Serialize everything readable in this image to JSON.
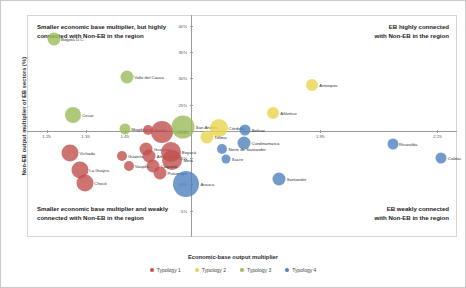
{
  "chart_data": {
    "type": "scatter",
    "title": "",
    "xlabel": "Economic-base output multiplier",
    "ylabel": "Non-EB output multiplier of EB sectors (%)",
    "xlim": [
      1.2,
      2.3
    ],
    "ylim": [
      0.0,
      42.0
    ],
    "xticks": [
      "1.25",
      "1.35",
      "1.45",
      "1.95",
      "2.25"
    ],
    "xtick_values": [
      1.25,
      1.35,
      1.45,
      1.95,
      2.25
    ],
    "yticks": [
      "40%",
      "35%",
      "30%",
      "25%",
      "20%",
      "15%",
      "10%",
      "5%"
    ],
    "ytick_values": [
      40,
      35,
      30,
      25,
      20,
      15,
      10,
      5
    ],
    "grid": false,
    "legend_position": "bottom",
    "quadrant_x": 1.62,
    "quadrant_y": 20.0,
    "annotations": {
      "top_left": "Smaller economic base multiplier, but highly\nconnected with Non-EB in the region",
      "top_right": "EB highly connected\nwith Non-EB in the region",
      "bottom_left": "Smaller economic base multiplier and weakly\nconnected with Non-EB in the region",
      "bottom_right": "EB weakly connected\nwith Non-EB in the region"
    },
    "series": [
      {
        "name": "Typology 1",
        "color": "#c0504d"
      },
      {
        "name": "Typology 2",
        "color": "#e8d44d"
      },
      {
        "name": "Typology 3",
        "color": "#9bbb59"
      },
      {
        "name": "Typology 4",
        "color": "#4f81bd"
      }
    ],
    "points": [
      {
        "label": "Bogotá D.C.",
        "x": 1.268,
        "y": 37.5,
        "size": 13,
        "series": "Typology 3"
      },
      {
        "label": "Valle del Cauca",
        "x": 1.455,
        "y": 30.2,
        "size": 13,
        "series": "Typology 3"
      },
      {
        "label": "Cesar",
        "x": 1.318,
        "y": 23.0,
        "size": 16,
        "series": "Typology 3"
      },
      {
        "label": "Magdalena",
        "x": 1.45,
        "y": 20.5,
        "size": 11,
        "series": "Typology 3"
      },
      {
        "label": "Nariño",
        "x": 1.51,
        "y": 20.3,
        "size": 10,
        "series": "Typology 1"
      },
      {
        "label": "Quindío",
        "x": 1.545,
        "y": 19.8,
        "size": 22,
        "series": "Typology 1"
      },
      {
        "label": "San Andrés",
        "x": 1.6,
        "y": 20.8,
        "size": 23,
        "series": "Typology 3"
      },
      {
        "label": "Córdoba",
        "x": 1.69,
        "y": 20.6,
        "size": 18,
        "series": "Typology 2"
      },
      {
        "label": "Tolima",
        "x": 1.66,
        "y": 19.0,
        "size": 13,
        "series": "Typology 2"
      },
      {
        "label": "Cundinamarca",
        "x": 1.755,
        "y": 17.8,
        "size": 13,
        "series": "Typology 4"
      },
      {
        "label": "Norte de Santander",
        "x": 1.7,
        "y": 16.6,
        "size": 10,
        "series": "Typology 4"
      },
      {
        "label": "Sucre",
        "x": 1.71,
        "y": 14.8,
        "size": 9,
        "series": "Typology 4"
      },
      {
        "label": "Guaviare",
        "x": 1.505,
        "y": 16.6,
        "size": 13,
        "series": "Typology 1"
      },
      {
        "label": "Amazonas",
        "x": 1.513,
        "y": 15.4,
        "size": 13,
        "series": "Typology 1"
      },
      {
        "label": "Boyacá",
        "x": 1.568,
        "y": 16.0,
        "size": 20,
        "series": "Typology 1"
      },
      {
        "label": "Meta",
        "x": 1.572,
        "y": 14.6,
        "size": 20,
        "series": "Typology 1"
      },
      {
        "label": "Caquetá",
        "x": 1.523,
        "y": 13.4,
        "size": 13,
        "series": "Typology 1"
      },
      {
        "label": "Putumayo",
        "x": 1.54,
        "y": 12.2,
        "size": 13,
        "series": "Typology 1"
      },
      {
        "label": "Guainía",
        "x": 1.443,
        "y": 15.4,
        "size": 10,
        "series": "Typology 1"
      },
      {
        "label": "Vaupés",
        "x": 1.46,
        "y": 13.4,
        "size": 10,
        "series": "Typology 1"
      },
      {
        "label": "Vichada",
        "x": 1.31,
        "y": 15.9,
        "size": 17,
        "series": "Typology 1"
      },
      {
        "label": "La Guajira",
        "x": 1.335,
        "y": 12.6,
        "size": 17,
        "series": "Typology 1"
      },
      {
        "label": "Chocó",
        "x": 1.348,
        "y": 10.2,
        "size": 17,
        "series": "Typology 1"
      },
      {
        "label": "Arauca",
        "x": 1.608,
        "y": 10.0,
        "size": 26,
        "series": "Typology 4"
      },
      {
        "label": "Antioquia",
        "x": 1.93,
        "y": 28.8,
        "size": 12,
        "series": "Typology 2"
      },
      {
        "label": "Atlántico",
        "x": 1.83,
        "y": 23.5,
        "size": 12,
        "series": "Typology 2"
      },
      {
        "label": "Bolívar",
        "x": 1.758,
        "y": 20.3,
        "size": 11,
        "series": "Typology 4"
      },
      {
        "label": "Risaralda",
        "x": 2.135,
        "y": 17.6,
        "size": 11,
        "series": "Typology 4"
      },
      {
        "label": "Caldas",
        "x": 2.26,
        "y": 15.0,
        "size": 11,
        "series": "Typology 4"
      },
      {
        "label": "Santander",
        "x": 1.845,
        "y": 11.0,
        "size": 13,
        "series": "Typology 4"
      }
    ]
  }
}
